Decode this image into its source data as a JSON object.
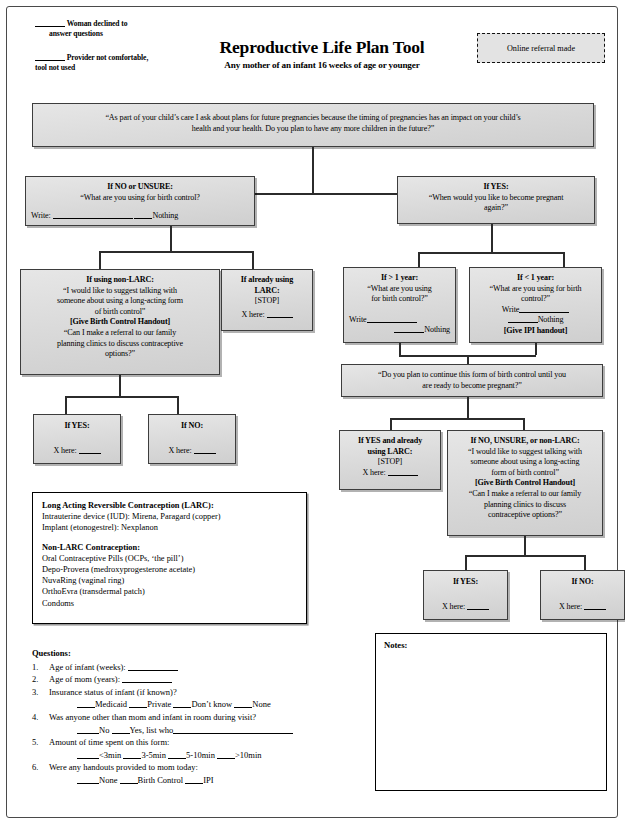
{
  "header": {
    "note1_blank": "_____",
    "note1_line1": "Woman declined to",
    "note1_line2": "answer questions",
    "note2_blank": "_____",
    "note2_line1": "Provider not comfortable,",
    "note2_line2": "tool not used",
    "title": "Reproductive Life Plan Tool",
    "subtitle": "Any mother of an infant 16 weeks of age or younger",
    "referral_label": "Online referral made"
  },
  "flow": {
    "root": {
      "line1": "“As part of your child’s care I ask about plans for future pregnancies because the timing of pregnancies has an impact on your child’s",
      "line2": "health and your health. Do you plan to have any more children in the future?”"
    },
    "no_unsure": {
      "heading": "If NO or UNSURE:",
      "line1": "“What are you using for birth control?",
      "write_label": "Write:",
      "nothing_label": "Nothing"
    },
    "yes": {
      "heading": "If YES:",
      "line1": "“When would you like to become pregnant",
      "line2": "again?”"
    },
    "non_larc": {
      "heading": "If using non-LARC:",
      "line1": "“I would like to suggest talking with",
      "line2": "someone about using a long-acting form",
      "line3": "of birth control”",
      "handout": "[Give Birth Control Handout]",
      "line4": "“Can I make a referral to our family",
      "line5": "planning clinics to discuss contraceptive",
      "line6": "options?”"
    },
    "already_larc": {
      "heading1": "If already using",
      "heading2": "LARC:",
      "stop": "[STOP]",
      "x_here": "X here:"
    },
    "gt_1_year": {
      "heading": "If > 1 year:",
      "line1": "“What are you using",
      "line2": "for birth control?”",
      "write_label": "Write",
      "nothing_label": "Nothing"
    },
    "lt_1_year": {
      "heading": "If < 1 year:",
      "line1": "“What are you using for birth",
      "line2": "control?”",
      "write_label": "Write",
      "nothing_label": "Nothing",
      "handout": "[Give IPI handout]"
    },
    "continue_q": {
      "line1": "“Do you plan to continue this form of birth control until you",
      "line2": "are ready to become pregnant?”"
    },
    "yes_already_larc": {
      "heading1": "If YES and already",
      "heading2": "using LARC:",
      "stop": "[STOP]",
      "x_here": "X here:"
    },
    "no_unsure_nonlarc": {
      "heading": "If NO, UNSURE, or non-LARC:",
      "line1": "“I would like to suggest talking with",
      "line2": "someone about using a long-acting",
      "line3": "form of birth control”",
      "handout": "[Give Birth Control Handout]",
      "line4": "“Can I make a referral to our family",
      "line5": "planning clinics to discuss",
      "line6": "contraceptive options?”"
    },
    "left_yes": {
      "heading": "If YES:",
      "x_here": "X here:"
    },
    "left_no": {
      "heading": "If NO:",
      "x_here": "X here:"
    },
    "right_yes": {
      "heading": "If YES:",
      "x_here": "X here:"
    },
    "right_no": {
      "heading": "If NO:",
      "x_here": "X here:"
    }
  },
  "legend": {
    "larc_head": "Long Acting Reversible Contraception (LARC):",
    "larc_1": "Intrauterine device (IUD): Mirena, Paragard (copper)",
    "larc_2": "Implant (etonogestrel): Nexplanon",
    "nonlarc_head": "Non-LARC Contraception:",
    "nonlarc_1": "Oral Contraceptive Pills (OCPs, ‘the pill’)",
    "nonlarc_2": "Depo-Provera (medroxyprogesterone acetate)",
    "nonlarc_3": "NuvaRing (vaginal ring)",
    "nonlarc_4": "OrthoEvra (transdermal patch)",
    "nonlarc_5": "Condoms"
  },
  "questions": {
    "title": "Questions:",
    "q1_num": "1.",
    "q1_text": "Age of infant (weeks):",
    "q2_num": "2.",
    "q2_text": "Age of mom (years):",
    "q3_num": "3.",
    "q3_text": "Insurance status of infant (if known)?",
    "q3_opt1": "Medicaid",
    "q3_opt2": "Private",
    "q3_opt3": "Don’t know",
    "q3_opt4": "None",
    "q4_num": "4.",
    "q4_text": "Was anyone other than mom and infant in room during visit?",
    "q4_opt1": "No",
    "q4_opt2": "Yes, list who",
    "q5_num": "5.",
    "q5_text": "Amount of time spent on this form:",
    "q5_opt1": "<3min",
    "q5_opt2": "3-5min",
    "q5_opt3": "5-10min",
    "q5_opt4": ">10min",
    "q6_num": "6.",
    "q6_text": "Were any handouts provided to mom today:",
    "q6_opt1": "None",
    "q6_opt2": "Birth Control",
    "q6_opt3": "IPI"
  },
  "notes": {
    "label": "Notes:"
  },
  "footer": {
    "caption": ""
  }
}
